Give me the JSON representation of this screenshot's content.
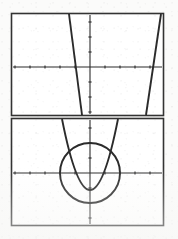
{
  "figure": {
    "name": "two-panel-graph-figure",
    "background_color": "#ffffff",
    "ink_color": "#2b2b2b",
    "frame_color": "#333333",
    "style": "scanned-graphing-calculator-screens",
    "panel_count": 2
  },
  "panels": [
    {
      "id": "top-panel",
      "label": "Top graph: two steep lines",
      "frame": {
        "x": 11,
        "y": 13,
        "width": 153,
        "height": 103
      },
      "axes": {
        "x_axis_y": 67,
        "y_axis_x": 90,
        "x_tick_spacing": 15,
        "y_tick_spacing": 15,
        "tick_length": 3,
        "grid": false
      },
      "curves": [
        {
          "name": "descending-line",
          "type": "line",
          "slope_sign": "negative",
          "enters": "top-edge",
          "exits": "bottom-edge",
          "top_x": 69,
          "bottom_x": 82,
          "x_intercept_px": 76,
          "description": "steep line with negative slope crossing x-axis left of origin"
        },
        {
          "name": "ascending-line",
          "type": "line",
          "slope_sign": "positive",
          "enters": "bottom-edge",
          "exits": "top-edge",
          "top_x": 161,
          "bottom_x": 146,
          "x_intercept_px": 153,
          "description": "steep line with positive slope crossing x-axis right of origin"
        }
      ]
    },
    {
      "id": "bottom-panel",
      "label": "Bottom graph: circle and parabola",
      "frame": {
        "x": 11,
        "y": 118,
        "width": 153,
        "height": 108
      },
      "axes": {
        "x_axis_y": 173,
        "y_axis_x": 90,
        "x_tick_spacing": 15,
        "y_tick_spacing": 15,
        "tick_length": 3,
        "grid": false
      },
      "curves": [
        {
          "name": "circle",
          "type": "circle",
          "center_px": [
            90,
            173
          ],
          "radius_px": 30,
          "description": "circle centered at the origin"
        },
        {
          "name": "parabola",
          "type": "parabola",
          "opens": "up",
          "vertex_px": [
            90,
            190
          ],
          "left_arm_top_x": 62,
          "right_arm_top_x": 118,
          "description": "upward parabola with vertex below the x-axis intersecting the circle"
        }
      ]
    }
  ],
  "chart_data": [
    {
      "type": "line",
      "title": "Top panel - two steep lines",
      "xlabel": "",
      "ylabel": "",
      "xlim": [
        -5,
        5
      ],
      "ylim": [
        -3.4,
        3.4
      ],
      "grid": false,
      "legend": "none",
      "xticks": [
        -5,
        -4,
        -3,
        -2,
        -1,
        0,
        1,
        2,
        3,
        4,
        5
      ],
      "yticks": [
        -3,
        -2,
        -1,
        0,
        1,
        2,
        3
      ],
      "series": [
        {
          "name": "descending-line",
          "x": [
            -0.85,
            -0.25
          ],
          "y": [
            3.4,
            -3.4
          ]
        },
        {
          "name": "ascending-line",
          "x": [
            1.85,
            2.35
          ],
          "y": [
            -3.4,
            3.4
          ]
        }
      ]
    },
    {
      "type": "line",
      "title": "Bottom panel - circle and parabola",
      "xlabel": "",
      "ylabel": "",
      "xlim": [
        -5,
        5
      ],
      "ylim": [
        -3.5,
        3.5
      ],
      "grid": false,
      "legend": "none",
      "xticks": [
        -5,
        -4,
        -3,
        -2,
        -1,
        0,
        1,
        2,
        3,
        4,
        5
      ],
      "yticks": [
        -3,
        -2,
        -1,
        0,
        1,
        2,
        3
      ],
      "series": [
        {
          "name": "circle",
          "equation": "x^2 + y^2 = 4",
          "center": [
            0,
            0
          ],
          "radius": 2
        },
        {
          "name": "parabola",
          "equation": "y = x^2 - 1.1",
          "vertex": [
            0,
            -1.1
          ],
          "opens": "up"
        }
      ]
    }
  ]
}
